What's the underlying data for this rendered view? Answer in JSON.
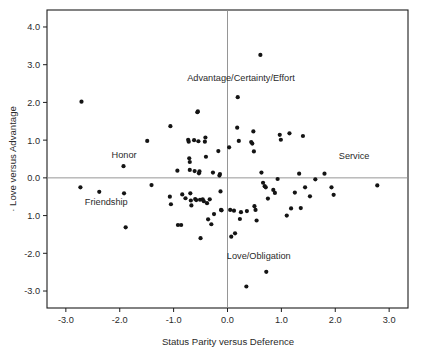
{
  "chart_data": {
    "type": "scatter",
    "title": "",
    "xlabel": "Status Parity versus Deference",
    "ylabel": "Love versus Advantage",
    "xlim": [
      -3.35,
      3.35
    ],
    "ylim": [
      -3.45,
      4.45
    ],
    "grid": false,
    "legend": null,
    "reference_lines": [
      {
        "axis": "x",
        "value": 0.0
      },
      {
        "axis": "y",
        "value": 0.0
      }
    ],
    "xticks": [
      -3.0,
      -2.0,
      -1.0,
      0.0,
      1.0,
      2.0,
      3.0
    ],
    "xticklabels": [
      "-3.0",
      "-2.0",
      "-1.0",
      "0.0",
      "1.0",
      "2.0",
      "3.0"
    ],
    "yticks": [
      4.0,
      3.0,
      2.0,
      1.0,
      0.0,
      -1.0,
      -2.0,
      -3.0
    ],
    "yticklabels": [
      "4.0",
      "3.0",
      "2.0",
      "1.0",
      "0.0",
      "1.0",
      "-2.0",
      "-3.0"
    ],
    "annotations": [
      {
        "text": "Advantage/Certainty/Effort",
        "x": 0.25,
        "y": 2.56
      },
      {
        "text": "Honor",
        "x": -1.92,
        "y": 0.52
      },
      {
        "text": "Service",
        "x": 2.35,
        "y": 0.5
      },
      {
        "text": "Friendship",
        "x": -2.25,
        "y": -0.73
      },
      {
        "text": "Love/Obligation",
        "x": 0.58,
        "y": -2.15
      }
    ],
    "points": [
      [
        -2.71,
        2.02
      ],
      [
        -2.73,
        -0.25
      ],
      [
        -2.38,
        -0.37
      ],
      [
        -1.93,
        0.31
      ],
      [
        -1.92,
        -0.41
      ],
      [
        -1.89,
        -1.31
      ],
      [
        -1.49,
        0.98
      ],
      [
        -1.41,
        -0.19
      ],
      [
        -1.06,
        1.37
      ],
      [
        -1.07,
        -0.5
      ],
      [
        -1.05,
        -0.7
      ],
      [
        -0.93,
        0.19
      ],
      [
        -0.92,
        -1.25
      ],
      [
        -0.86,
        -1.25
      ],
      [
        -0.84,
        -0.44
      ],
      [
        -0.78,
        -0.54
      ],
      [
        -0.73,
        1.01
      ],
      [
        -0.72,
        0.96
      ],
      [
        -0.71,
        0.52
      ],
      [
        -0.7,
        0.42
      ],
      [
        -0.7,
        0.21
      ],
      [
        -0.69,
        -0.41
      ],
      [
        -0.68,
        -0.6
      ],
      [
        -0.67,
        -0.73
      ],
      [
        -0.62,
        1.0
      ],
      [
        -0.61,
        0.18
      ],
      [
        -0.6,
        -0.56
      ],
      [
        -0.58,
        -0.59
      ],
      [
        -0.55,
        1.76
      ],
      [
        -0.56,
        1.74
      ],
      [
        -0.54,
        0.97
      ],
      [
        -0.53,
        0.12
      ],
      [
        -0.52,
        0.17
      ],
      [
        -0.51,
        -0.58
      ],
      [
        -0.5,
        -1.6
      ],
      [
        -0.46,
        -0.57
      ],
      [
        -0.44,
        -0.62
      ],
      [
        -0.42,
        0.96
      ],
      [
        -0.41,
        1.07
      ],
      [
        -0.4,
        0.56
      ],
      [
        -0.38,
        -0.67
      ],
      [
        -0.36,
        -1.1
      ],
      [
        -0.33,
        -0.57
      ],
      [
        -0.3,
        -1.23
      ],
      [
        -0.27,
        0.14
      ],
      [
        -0.25,
        -0.96
      ],
      [
        -0.17,
        0.71
      ],
      [
        -0.15,
        0.06
      ],
      [
        -0.14,
        0.1
      ],
      [
        -0.13,
        -0.36
      ],
      [
        -0.12,
        -0.85
      ],
      [
        -0.11,
        -0.86
      ],
      [
        0.03,
        0.81
      ],
      [
        0.05,
        -0.85
      ],
      [
        0.07,
        -1.56
      ],
      [
        0.12,
        -0.87
      ],
      [
        0.14,
        -1.47
      ],
      [
        0.18,
        1.33
      ],
      [
        0.19,
        2.14
      ],
      [
        0.21,
        0.98
      ],
      [
        0.23,
        -1.09
      ],
      [
        0.25,
        -0.91
      ],
      [
        0.35,
        -2.88
      ],
      [
        0.36,
        -0.88
      ],
      [
        0.44,
        0.95
      ],
      [
        0.46,
        0.91
      ],
      [
        0.48,
        1.23
      ],
      [
        0.49,
        0.7
      ],
      [
        0.5,
        -0.75
      ],
      [
        0.52,
        -0.85
      ],
      [
        0.54,
        -1.13
      ],
      [
        0.61,
        3.26
      ],
      [
        0.63,
        0.14
      ],
      [
        0.66,
        -0.13
      ],
      [
        0.69,
        -0.22
      ],
      [
        0.71,
        -0.25
      ],
      [
        0.72,
        -2.49
      ],
      [
        0.75,
        -0.55
      ],
      [
        0.85,
        -0.32
      ],
      [
        0.88,
        -0.4
      ],
      [
        0.93,
        -0.03
      ],
      [
        0.97,
        1.14
      ],
      [
        0.99,
        1.01
      ],
      [
        1.1,
        -1.0
      ],
      [
        1.15,
        1.18
      ],
      [
        1.18,
        -0.81
      ],
      [
        1.25,
        -0.39
      ],
      [
        1.33,
        0.11
      ],
      [
        1.36,
        -0.8
      ],
      [
        1.4,
        1.11
      ],
      [
        1.44,
        -0.25
      ],
      [
        1.53,
        -0.49
      ],
      [
        1.63,
        -0.04
      ],
      [
        1.8,
        0.11
      ],
      [
        1.93,
        -0.25
      ],
      [
        1.97,
        -0.45
      ],
      [
        2.78,
        -0.2
      ]
    ]
  },
  "axis": {
    "x_title": "Status Parity versus Deference",
    "y_title": "Love versus Advantage",
    "y_title_prefix": "·"
  }
}
